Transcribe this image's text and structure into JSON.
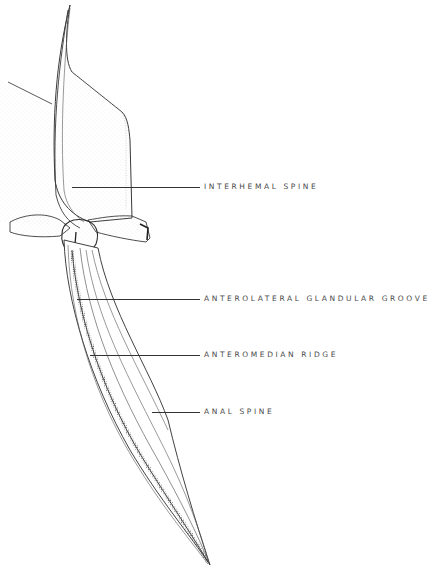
{
  "figure": {
    "ink_color": "#2b2b2b",
    "stipple_color": "#9a9a9a",
    "background": "#ffffff"
  },
  "labels": [
    {
      "id": "interhemal-spine",
      "text": "INTERHEMAL SPINE",
      "line_x1": 72,
      "line_x2": 200,
      "y": 187,
      "text_x": 204
    },
    {
      "id": "anterolateral-glandular-groove",
      "text": "ANTEROLATERAL GLANDULAR GROOVE",
      "line_x1": 77,
      "line_x2": 200,
      "y": 299,
      "text_x": 204
    },
    {
      "id": "anteromedian-ridge",
      "text": "ANTEROMEDIAN RIDGE",
      "line_x1": 90,
      "line_x2": 200,
      "y": 355,
      "text_x": 204
    },
    {
      "id": "anal-spine",
      "text": "ANAL SPINE",
      "line_x1": 152,
      "line_x2": 200,
      "y": 412,
      "text_x": 204
    }
  ]
}
